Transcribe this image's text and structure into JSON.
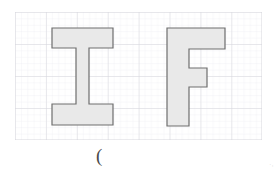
{
  "figure": {
    "title": "",
    "background_color": "#ffffff",
    "grid": {
      "origin_x": 15,
      "origin_y": 12,
      "width": 247,
      "height": 128,
      "major_spacing": 30.9,
      "minor_spacing": 6.2,
      "major_color": "#d2d2d8",
      "minor_color": "#e9e9ef",
      "columns": 8,
      "rows": 4
    },
    "shapes": [
      {
        "name": "letter-I",
        "label": "I",
        "fill": "#e9e9e9",
        "stroke": "#6e6e6e",
        "stroke_width": 1.2,
        "points": "52,28 113,28 113,48 89,48 89,104 113,104 113,125 52,125 52,104 76,104 76,48 52,48"
      },
      {
        "name": "letter-F",
        "label": "F",
        "fill": "#e9e9e9",
        "stroke": "#6e6e6e",
        "stroke_width": 1.2,
        "points": "167,28 225,28 225,49 189,49 189,68 207,68 207,87 189,87 189,126 167,126"
      }
    ],
    "caption": "(",
    "corner_mark": "·,"
  }
}
